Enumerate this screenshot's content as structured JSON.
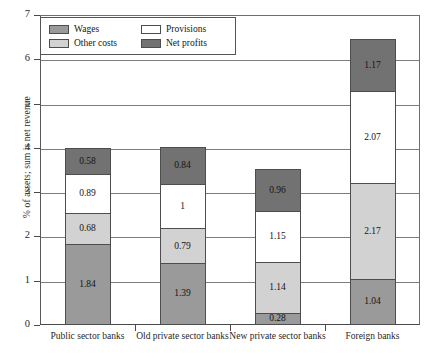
{
  "chart_data": {
    "type": "bar",
    "stacked": true,
    "title": "",
    "xlabel": "",
    "ylabel": "% of assets; sum is net revenue",
    "ylim": [
      0,
      7
    ],
    "yticks": [
      "0",
      "1",
      "2",
      "3",
      "4",
      "5",
      "6",
      "7"
    ],
    "grid": true,
    "legend_position": "top-left",
    "categories": [
      "Public sector banks",
      "Old private sector banks",
      "New private sector banks",
      "Foreign banks"
    ],
    "series": [
      {
        "name": "Wages",
        "color": "#9a9a9a",
        "values": [
          1.84,
          1.39,
          0.28,
          1.04
        ],
        "labels": [
          "1.84",
          "1.39",
          "0.28",
          "1.04"
        ]
      },
      {
        "name": "Other costs",
        "color": "#d2d2d2",
        "values": [
          0.68,
          0.79,
          1.14,
          2.17
        ],
        "labels": [
          "0.68",
          "0.79",
          "1.14",
          "2.17"
        ]
      },
      {
        "name": "Provisions",
        "color": "#ffffff",
        "values": [
          0.89,
          1.0,
          1.15,
          2.07
        ],
        "labels": [
          "0.89",
          "1",
          "1.15",
          "2.07"
        ]
      },
      {
        "name": "Net profits",
        "color": "#727272",
        "values": [
          0.58,
          0.84,
          0.96,
          1.17
        ],
        "labels": [
          "0.58",
          "0.84",
          "0.96",
          "1.17"
        ]
      }
    ],
    "totals": [
      3.99,
      4.02,
      3.53,
      6.45
    ]
  }
}
